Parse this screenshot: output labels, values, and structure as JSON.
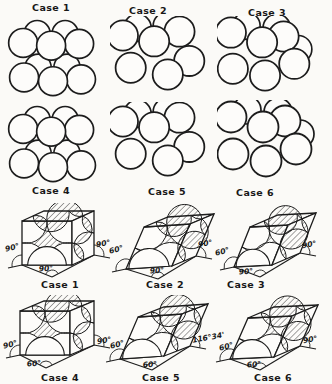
{
  "figure": {
    "ink_color": "#1c1c1c",
    "paper_color": "#fbfaf7"
  },
  "sphere_clusters": {
    "row1": [
      {
        "label": "Case 1"
      },
      {
        "label": "Case 2"
      },
      {
        "label": "Case 3"
      }
    ],
    "row2": [
      {
        "label": "Case 4"
      },
      {
        "label": "Case 5"
      },
      {
        "label": "Case 6"
      }
    ]
  },
  "unit_cells": [
    {
      "caption": "Case 1",
      "left_angle": "90°",
      "right_angle": "90°",
      "base_angle": "90°"
    },
    {
      "caption": "Case 2",
      "left_angle": "60°",
      "right_angle": "90°",
      "base_angle": "90°"
    },
    {
      "caption": "Case 3",
      "left_angle": "60°",
      "right_angle": "90°",
      "base_angle": "90°"
    },
    {
      "caption": "Case 4",
      "left_angle": "90°",
      "right_angle": "90°",
      "base_angle": "60°"
    },
    {
      "caption": "Case 5",
      "left_angle": "60°",
      "right_angle": "116°34'",
      "base_angle": "60°"
    },
    {
      "caption": "Case 6",
      "left_angle": "60°",
      "right_angle": "90°",
      "base_angle": "60°"
    }
  ]
}
